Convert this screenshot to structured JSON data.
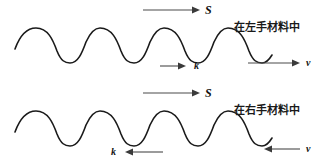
{
  "figure": {
    "width": 319,
    "height": 166,
    "background": "#ffffff",
    "wave_color": "#1a1a1a",
    "arrow_color": "#4a4a4a",
    "text_color": "#111111"
  },
  "panels": [
    {
      "id": "left-handed-material",
      "caption": "在左手材料中",
      "wave": {
        "amplitude": 17,
        "wavelength": 85,
        "baseline_y": 45,
        "x_start": 15,
        "x_end": 272,
        "peaks_y": 28,
        "troughs_y": 62
      },
      "vectors": [
        {
          "name": "S",
          "label": "S",
          "direction": "right"
        },
        {
          "name": "k",
          "label": "k",
          "direction": "right"
        },
        {
          "name": "v",
          "label": "v",
          "direction": "right"
        }
      ]
    },
    {
      "id": "right-handed-material",
      "caption": "在右手材料中",
      "wave": {
        "amplitude": 17,
        "wavelength": 85,
        "baseline_y": 128,
        "x_start": 15,
        "x_end": 272,
        "peaks_y": 111,
        "troughs_y": 145
      },
      "vectors": [
        {
          "name": "S",
          "label": "S",
          "direction": "right"
        },
        {
          "name": "k",
          "label": "k",
          "direction": "left"
        },
        {
          "name": "v",
          "label": "v",
          "direction": "left"
        }
      ]
    }
  ],
  "symbols": {
    "top_s": "S",
    "top_k": "k",
    "top_v": "v",
    "bottom_s": "S",
    "bottom_k": "k",
    "bottom_v": "v"
  },
  "captions": {
    "top": "在左手材料中",
    "bottom": "在右手材料中"
  }
}
